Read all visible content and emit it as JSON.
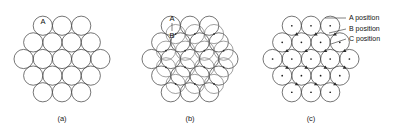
{
  "figure": {
    "title_visible": false,
    "background_color": "#ffffff",
    "line_color": "#3b3b3b",
    "text_color": "#111111",
    "width": 394,
    "height": 130
  },
  "panels": [
    {
      "id": "a",
      "caption": "(a)",
      "caption_x": 62,
      "caption_y": 121,
      "center_x": 62,
      "center_y": 59,
      "radius": 9.6,
      "spacing": 19.2,
      "layers": [
        "A"
      ],
      "rows": [
        3,
        4,
        5,
        4,
        3
      ],
      "circle_count": 19,
      "show_center_dots": false,
      "show_interstices": false,
      "labels": [
        {
          "text": "A",
          "x": 43,
          "y": 24,
          "name": "a-position-label"
        }
      ]
    },
    {
      "id": "b",
      "caption": "(b)",
      "caption_x": 190,
      "caption_y": 121,
      "center_x": 190,
      "center_y": 59,
      "radius": 9.6,
      "spacing": 19.2,
      "layers": [
        "A",
        "B"
      ],
      "rows": [
        3,
        4,
        5,
        4,
        3
      ],
      "circle_count": 19,
      "second_layer_rows": [
        2,
        3,
        4,
        3,
        2
      ],
      "show_center_dots": false,
      "show_interstices": true,
      "labels": [
        {
          "text": "A",
          "x": 172,
          "y": 21,
          "name": "a-position-label"
        },
        {
          "text": "B",
          "x": 172,
          "y": 38,
          "name": "b-position-label"
        }
      ]
    },
    {
      "id": "c",
      "caption": "(c)",
      "caption_x": 311,
      "caption_y": 121,
      "center_x": 311,
      "center_y": 59,
      "radius": 9.6,
      "spacing": 19.2,
      "layers": [
        "A",
        "B",
        "C"
      ],
      "rows": [
        3,
        4,
        5,
        4,
        3
      ],
      "circle_count": 19,
      "show_center_dots": true,
      "show_interstices": true,
      "labels": []
    }
  ],
  "legend": {
    "position": "right",
    "items": [
      {
        "key": "A",
        "label": "A position",
        "text_x": 349,
        "text_y": 20,
        "leader_from_x": 325,
        "leader_from_y": 18,
        "leader_to_x": 346,
        "leader_to_y": 18
      },
      {
        "key": "B",
        "label": "B position",
        "text_x": 349,
        "text_y": 31,
        "leader_from_x": 329,
        "leader_from_y": 33,
        "leader_to_x": 346,
        "leader_to_y": 29
      },
      {
        "key": "C",
        "label": "C position",
        "text_x": 349,
        "text_y": 41,
        "leader_from_x": 331,
        "leader_from_y": 44,
        "leader_to_x": 346,
        "leader_to_y": 39
      }
    ]
  }
}
